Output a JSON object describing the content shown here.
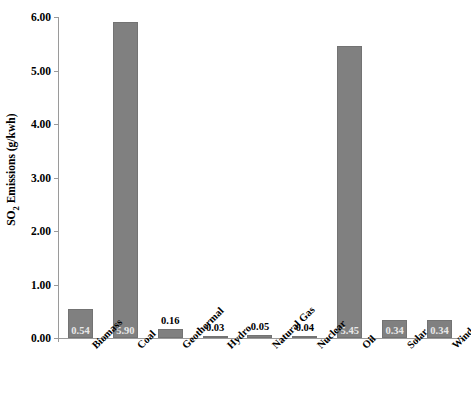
{
  "chart_data": {
    "type": "bar",
    "title": "",
    "subtitle": "",
    "xlabel": "",
    "ylabel": "SO2 Emissions (g/kwh)",
    "ylabel_parts": {
      "prefix": "SO",
      "subscript": "2",
      "suffix": " Emissions (g/kwh)"
    },
    "categories": [
      "Biomass",
      "Coal",
      "Geothermal",
      "Hydro",
      "Natural Gas",
      "Nuclear",
      "Oil",
      "Solar",
      "Wind"
    ],
    "values": [
      0.54,
      5.9,
      0.16,
      0.03,
      0.05,
      0.04,
      5.45,
      0.34,
      0.34
    ],
    "value_labels": [
      "0.54",
      "5.90",
      "0.16",
      "0.03",
      "0.05",
      "0.04",
      "5.45",
      "0.34",
      "0.34"
    ],
    "label_placement": [
      "inside",
      "inside",
      "above",
      "above",
      "above",
      "above",
      "inside",
      "inside",
      "inside"
    ],
    "ylim": [
      0.0,
      6.0
    ],
    "ytick_values": [
      0.0,
      1.0,
      2.0,
      3.0,
      4.0,
      5.0,
      6.0
    ],
    "ytick_labels": [
      "0.00",
      "1.00",
      "2.00",
      "3.00",
      "4.00",
      "5.00",
      "6.00"
    ],
    "grid": false,
    "legend": false,
    "legend_position": "none",
    "bar_color": "#808080",
    "bar_edge_color": "#737373",
    "axis_color": "#9a9a9a",
    "background_color": "#ffffff",
    "inside_label_color": "#e8e8e8",
    "outside_label_color": "#000000"
  }
}
